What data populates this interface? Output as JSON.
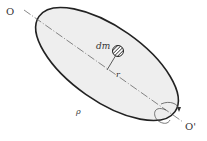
{
  "diagram": {
    "labels": {
      "axis_start": "O",
      "axis_end": "O'",
      "mass_element": "dm",
      "radius": "r",
      "density": "ρ"
    },
    "colors": {
      "body_fill": "#eeeeee",
      "body_stroke": "#222222",
      "axis": "#444444",
      "mass_element": "#333333"
    }
  }
}
